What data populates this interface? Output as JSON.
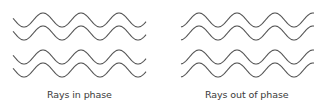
{
  "panels": [
    {
      "id": "in-phase",
      "caption": "Rays in phase",
      "x_start": 13,
      "x_end": 146,
      "first_peak_x": 43,
      "wavelength": 38,
      "amplitude": 7,
      "rows_y": [
        20,
        33,
        57,
        70
      ],
      "caption_x": 47
    },
    {
      "id": "out-of-phase",
      "caption": "Rays out of phase",
      "x_start": 181,
      "x_end": 314,
      "first_peak_x": 199,
      "wavelength": 38,
      "amplitude": 7,
      "rows_y": [
        20,
        33,
        57,
        70
      ],
      "caption_x": 205
    }
  ],
  "colors": {
    "wave": "#555555",
    "text": "#3a3a3a",
    "background": "#ffffff"
  }
}
